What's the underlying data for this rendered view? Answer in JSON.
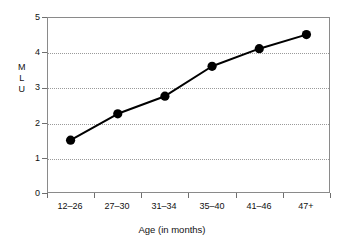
{
  "chart_data": {
    "type": "line",
    "title": "",
    "xlabel": "Age (in months)",
    "ylabel": "MLU",
    "ylabel_letters": [
      "M",
      "L",
      "U"
    ],
    "categories": [
      "12–26",
      "27–30",
      "31–34",
      "35–40",
      "41–46",
      "47+"
    ],
    "values": [
      1.5,
      2.25,
      2.75,
      3.6,
      4.1,
      4.5
    ],
    "series": [
      {
        "name": "MLU",
        "values": [
          1.5,
          2.25,
          2.75,
          3.6,
          4.1,
          4.5
        ],
        "marker": "filled-circle",
        "color": "#000000"
      }
    ],
    "ylim": [
      0,
      5
    ],
    "yticks": [
      0,
      1,
      2,
      3,
      4,
      5
    ],
    "ytick_labels": [
      "0",
      "1",
      "2",
      "3",
      "4",
      "5"
    ],
    "grid": "horizontal-dotted",
    "legend": "none",
    "colors": {
      "line": "#000000",
      "marker": "#000000",
      "grid": "#9a9a9a",
      "frame": "#8a8a8a",
      "background": "#ffffff",
      "text": "#111111"
    }
  }
}
